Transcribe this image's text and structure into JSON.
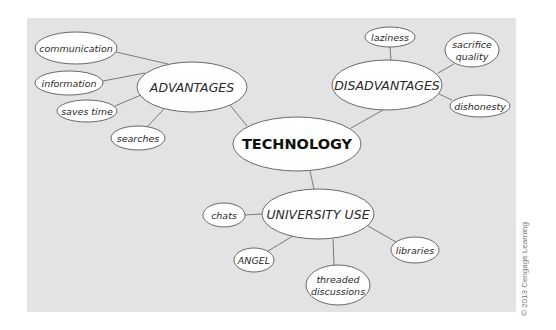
{
  "diagram": {
    "type": "mind-map",
    "root": {
      "id": "technology",
      "label": "TECHNOLOGY",
      "cx": 297,
      "cy": 144,
      "rx": 64,
      "ry": 27
    },
    "branches": [
      {
        "id": "advantages",
        "label": "ADVANTAGES",
        "cx": 192,
        "cy": 87,
        "rx": 55,
        "ry": 25
      },
      {
        "id": "disadvantages",
        "label": "DISADVANTAGES",
        "cx": 387,
        "cy": 85,
        "rx": 55,
        "ry": 25
      },
      {
        "id": "university-use",
        "label": "UNIVERSITY USE",
        "cx": 318,
        "cy": 214,
        "rx": 56,
        "ry": 25
      }
    ],
    "leaves": [
      {
        "id": "communication",
        "parent": "advantages",
        "lines": [
          "communication"
        ],
        "cx": 76,
        "cy": 48,
        "rx": 41,
        "ry": 16
      },
      {
        "id": "information",
        "parent": "advantages",
        "lines": [
          "information"
        ],
        "cx": 69,
        "cy": 83,
        "rx": 34,
        "ry": 12
      },
      {
        "id": "saves-time",
        "parent": "advantages",
        "lines": [
          "saves time"
        ],
        "cx": 87,
        "cy": 111,
        "rx": 30,
        "ry": 11
      },
      {
        "id": "searches",
        "parent": "advantages",
        "lines": [
          "searches"
        ],
        "cx": 138,
        "cy": 138,
        "rx": 27,
        "ry": 12
      },
      {
        "id": "laziness",
        "parent": "disadvantages",
        "lines": [
          "laziness"
        ],
        "cx": 390,
        "cy": 37,
        "rx": 25,
        "ry": 10
      },
      {
        "id": "sacrifice-quality",
        "parent": "disadvantages",
        "lines": [
          "sacrifice",
          "quality"
        ],
        "cx": 472,
        "cy": 50,
        "rx": 27,
        "ry": 17
      },
      {
        "id": "dishonesty",
        "parent": "disadvantages",
        "lines": [
          "dishonesty"
        ],
        "cx": 480,
        "cy": 106,
        "rx": 30,
        "ry": 11
      },
      {
        "id": "chats",
        "parent": "university-use",
        "lines": [
          "chats"
        ],
        "cx": 224,
        "cy": 215,
        "rx": 21,
        "ry": 12
      },
      {
        "id": "angel",
        "parent": "university-use",
        "lines": [
          "ANGEL"
        ],
        "cx": 254,
        "cy": 260,
        "rx": 20,
        "ry": 12
      },
      {
        "id": "threaded-discussions",
        "parent": "university-use",
        "lines": [
          "threaded",
          "discussions"
        ],
        "cx": 338,
        "cy": 285,
        "rx": 32,
        "ry": 20
      },
      {
        "id": "libraries",
        "parent": "university-use",
        "lines": [
          "libraries"
        ],
        "cx": 415,
        "cy": 250,
        "rx": 24,
        "ry": 13
      }
    ],
    "edges": [
      {
        "from": "technology",
        "to": "advantages",
        "x1": 247,
        "y1": 126,
        "x2": 230,
        "y2": 105
      },
      {
        "from": "technology",
        "to": "disadvantages",
        "x1": 351,
        "y1": 128,
        "x2": 383,
        "y2": 110
      },
      {
        "from": "technology",
        "to": "university-use",
        "x1": 310,
        "y1": 171,
        "x2": 314,
        "y2": 189
      },
      {
        "from": "advantages",
        "to": "communication",
        "x1": 116,
        "y1": 52,
        "x2": 168,
        "y2": 64
      },
      {
        "from": "advantages",
        "to": "information",
        "x1": 103,
        "y1": 81,
        "x2": 145,
        "y2": 73
      },
      {
        "from": "advantages",
        "to": "saves-time",
        "x1": 115,
        "y1": 106,
        "x2": 141,
        "y2": 95
      },
      {
        "from": "advantages",
        "to": "searches",
        "x1": 147,
        "y1": 127,
        "x2": 164,
        "y2": 109
      },
      {
        "from": "disadvantages",
        "to": "laziness",
        "x1": 390,
        "y1": 47,
        "x2": 391,
        "y2": 60
      },
      {
        "from": "disadvantages",
        "to": "sacrifice-quality",
        "x1": 454,
        "y1": 64,
        "x2": 438,
        "y2": 73
      },
      {
        "from": "disadvantages",
        "to": "dishonesty",
        "x1": 439,
        "y1": 94,
        "x2": 452,
        "y2": 100
      },
      {
        "from": "university-use",
        "to": "chats",
        "x1": 245,
        "y1": 215,
        "x2": 262,
        "y2": 214
      },
      {
        "from": "university-use",
        "to": "angel",
        "x1": 268,
        "y1": 251,
        "x2": 293,
        "y2": 236
      },
      {
        "from": "university-use",
        "to": "threaded-discussions",
        "x1": 334,
        "y1": 265,
        "x2": 333,
        "y2": 239
      },
      {
        "from": "university-use",
        "to": "libraries",
        "x1": 396,
        "y1": 242,
        "x2": 368,
        "y2": 226
      }
    ]
  },
  "colors": {
    "background": "#ffffff",
    "panel": "#e3e3e3",
    "node_fill": "#ffffff",
    "node_stroke": "#5a5a5a",
    "edge": "#6e6e6e",
    "text": "#2a2a2a",
    "credit_text": "#777777"
  },
  "credit": {
    "text": "© 2013 Cengage Learning"
  }
}
